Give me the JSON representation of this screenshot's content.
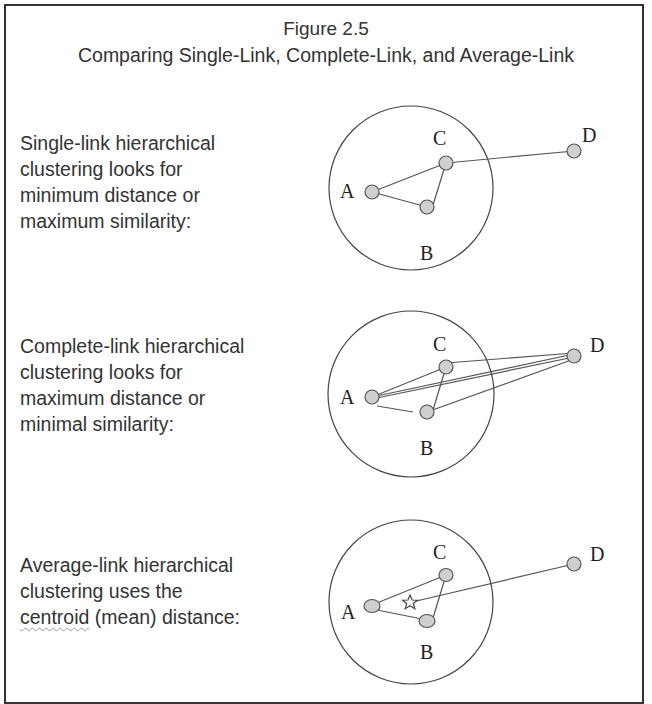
{
  "figure": {
    "number": "Figure 2.5",
    "title": "Comparing Single-Link, Complete-Link, and Average-Link"
  },
  "panels": [
    {
      "method": "single-link",
      "description_lines": [
        "Single-link hierarchical",
        "clustering looks for",
        "minimum distance or",
        "maximum similarity:"
      ],
      "points": [
        "A",
        "B",
        "C",
        "D"
      ],
      "links": "C-D only (closest pair across clusters)"
    },
    {
      "method": "complete-link",
      "description_lines": [
        "Complete-link hierarchical",
        "clustering looks for",
        "maximum distance or",
        "minimal similarity:"
      ],
      "points": [
        "A",
        "B",
        "C",
        "D"
      ],
      "links": "A-D, B-D, C-D"
    },
    {
      "method": "average-link",
      "description_lines": [
        "Average-link hierarchical",
        "clustering uses the",
        "centroid",
        " (mean) distance:"
      ],
      "points": [
        "A",
        "B",
        "C",
        "D"
      ],
      "centroid_marker": "star",
      "links": "centroid-D"
    }
  ],
  "labels": {
    "A": "A",
    "B": "B",
    "C": "C",
    "D": "D"
  }
}
